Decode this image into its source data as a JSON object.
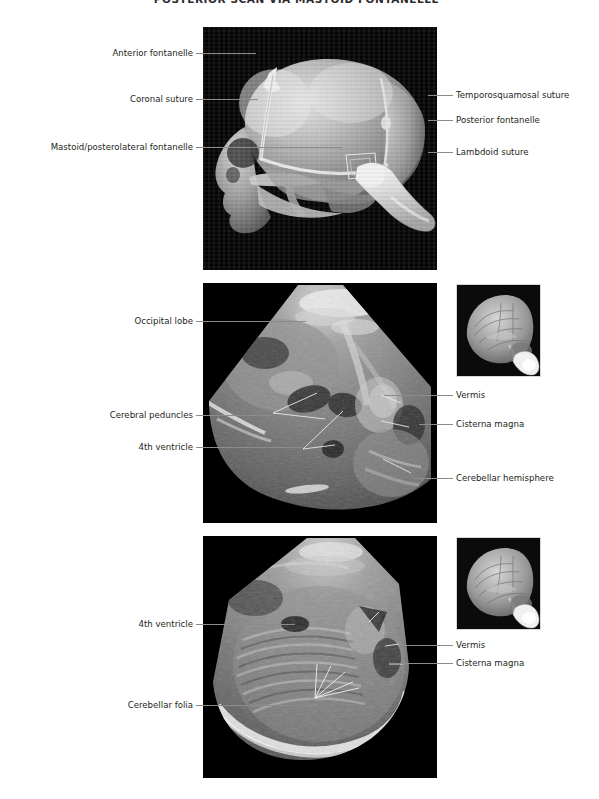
{
  "figure": {
    "title": "POSTERIOR SCAN VIA MASTOID FONTANELLE"
  },
  "panels": [
    {
      "id": "panel-skull",
      "name": "infant-skull-3d-probe-placement",
      "description": "3D rendered lateral view of neonatal skull with ultrasound transducer at the mastoid fontanelle",
      "labels_left": [
        {
          "text": "Anterior fontanelle"
        },
        {
          "text": "Coronal suture"
        },
        {
          "text": "Mastoid/posterolateral fontanelle"
        }
      ],
      "labels_right": [
        {
          "text": "Temporosquamosal suture"
        },
        {
          "text": "Posterior fontanelle"
        },
        {
          "text": "Lambdoid suture"
        }
      ]
    },
    {
      "id": "panel-us-1",
      "name": "mastoid-view-ultrasound-upper",
      "description": "Axial posterior fossa ultrasound obtained through the mastoid fontanelle",
      "labels_left": [
        {
          "text": "Occipital lobe"
        },
        {
          "text": "Cerebral peduncles"
        },
        {
          "text": "4th ventricle"
        }
      ],
      "labels_right": [
        {
          "text": "Vermis"
        },
        {
          "text": "Cisterna magna"
        },
        {
          "text": "Cerebellar hemisphere"
        }
      ],
      "inset": {
        "name": "sagittal-brain-probe-inset"
      }
    },
    {
      "id": "panel-us-2",
      "name": "mastoid-view-ultrasound-lower",
      "description": "Lower axial posterior fossa ultrasound through the mastoid fontanelle",
      "labels_left": [
        {
          "text": "4th ventricle"
        },
        {
          "text": "Cerebellar folia"
        }
      ],
      "labels_right": [
        {
          "text": "Vermis"
        },
        {
          "text": "Cisterna magna"
        }
      ],
      "inset": {
        "name": "sagittal-brain-probe-inset"
      }
    }
  ],
  "colors": {
    "background": "#ffffff",
    "text": "#231f20",
    "leader_line": "#8c8c8c",
    "panel_background": "#000000"
  }
}
